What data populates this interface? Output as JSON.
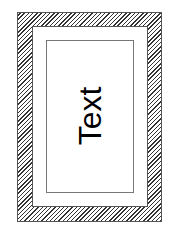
{
  "diagram": {
    "label": "Text",
    "colors": {
      "hatch": "#333333",
      "background": "#ffffff",
      "border": "#555555",
      "text": "#000000"
    },
    "layers": [
      {
        "name": "hatched-outer-frame",
        "fill": "diagonal-hatch"
      },
      {
        "name": "white-margin-frame",
        "fill": "white"
      },
      {
        "name": "inner-text-box",
        "fill": "white"
      }
    ]
  }
}
